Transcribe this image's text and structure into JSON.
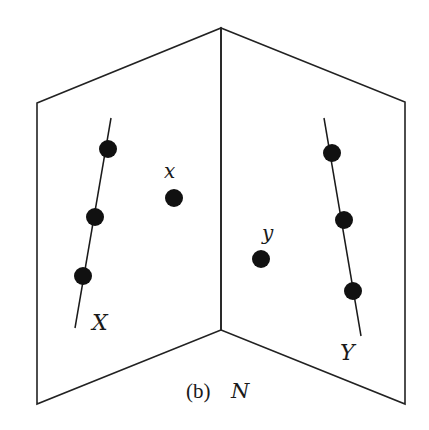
{
  "figure": {
    "caption_prefix": "(b)",
    "caption_symbol": "N",
    "labels": {
      "line_left": "X",
      "line_right": "Y",
      "point_left": "x",
      "point_right": "y"
    }
  },
  "geometry": {
    "left_panel": [
      [
        37,
        103
      ],
      [
        221,
        28
      ],
      [
        221,
        330
      ],
      [
        37,
        404
      ]
    ],
    "right_panel": [
      [
        221,
        28
      ],
      [
        405,
        102
      ],
      [
        405,
        404
      ],
      [
        221,
        330
      ]
    ],
    "line_X": {
      "from": [
        111,
        118
      ],
      "to": [
        75,
        328
      ],
      "dots": [
        [
          108,
          149
        ],
        [
          95,
          217
        ],
        [
          83,
          276
        ]
      ]
    },
    "line_Y": {
      "from": [
        324,
        118
      ],
      "to": [
        361,
        336
      ],
      "dots": [
        [
          332,
          153
        ],
        [
          344,
          220
        ],
        [
          353,
          291
        ]
      ]
    },
    "point_x": [
      174,
      198
    ],
    "point_y": [
      261,
      259
    ]
  },
  "colors": {
    "stroke": "#222222",
    "dot": "#111111",
    "background": "#ffffff"
  }
}
